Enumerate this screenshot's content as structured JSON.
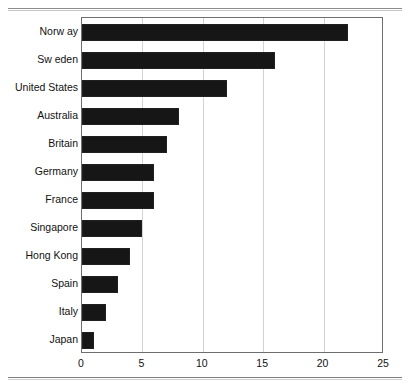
{
  "chart_data": {
    "type": "bar",
    "orientation": "horizontal",
    "title": "",
    "subtitle": "",
    "xlabel": "",
    "ylabel": "",
    "xlim": [
      0,
      25
    ],
    "xticks": [
      0,
      5,
      10,
      15,
      20,
      25
    ],
    "xticklabels": [
      "0",
      "5",
      "10",
      "15",
      "20",
      "25"
    ],
    "gridlines": [
      5,
      10,
      15,
      20
    ],
    "grid": true,
    "legend": null,
    "bar_color": "#161616",
    "frame_color": "#6e6e6e",
    "grid_color": "#d2d2d2",
    "categories": [
      "Norw ay",
      "Sw eden",
      "United States",
      "Australia",
      "Britain",
      "Germany",
      "France",
      "Singapore",
      "Hong Kong",
      "Spain",
      "Italy",
      "Japan"
    ],
    "values": [
      22,
      16,
      12,
      8,
      7,
      6,
      6,
      5,
      4,
      3,
      2,
      1
    ]
  }
}
